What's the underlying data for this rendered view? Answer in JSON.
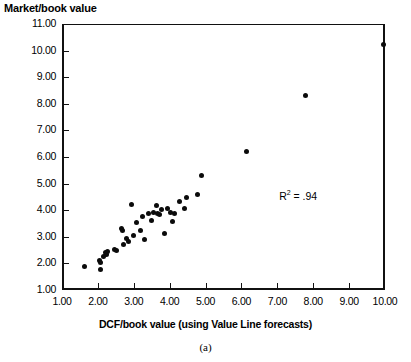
{
  "figure": {
    "panel_label": "(a)",
    "y_axis_title": "Market/book value",
    "x_axis_title": "DCF/book value (using Value Line forecasts)",
    "annotation_r2_prefix": "R",
    "annotation_r2_exponent": "2",
    "annotation_r2_value": " = .94"
  },
  "chart_data": {
    "type": "scatter",
    "title": "",
    "xlabel": "DCF/book value (using Value Line forecasts)",
    "ylabel": "Market/book value",
    "xlim": [
      1.0,
      10.0
    ],
    "ylim": [
      1.0,
      11.0
    ],
    "grid": false,
    "legend": "none",
    "xticks": [
      1.0,
      2.0,
      3.0,
      4.0,
      5.0,
      6.0,
      7.0,
      8.0,
      9.0,
      10.0
    ],
    "xtick_labels": [
      "1.00",
      "2.00",
      "3.00",
      "4.00",
      "5.00",
      "6.00",
      "7.00",
      "8.00",
      "9.00",
      "10.00"
    ],
    "yticks": [
      1.0,
      2.0,
      3.0,
      4.0,
      5.0,
      6.0,
      7.0,
      8.0,
      9.0,
      10.0,
      11.0
    ],
    "ytick_labels": [
      "1.00",
      "2.00",
      "3.00",
      "4.00",
      "5.00",
      "6.00",
      "7.00",
      "8.00",
      "9.00",
      "10.00",
      "11.00"
    ],
    "annotations": [
      {
        "text": "R2 = .94",
        "x": 7.05,
        "y": 4.55
      }
    ],
    "marker": {
      "shape": "circle",
      "color": "#0b0b0b",
      "size": 5
    },
    "points": [
      {
        "x": 1.63,
        "y": 1.88
      },
      {
        "x": 2.05,
        "y": 2.1
      },
      {
        "x": 2.06,
        "y": 2.02
      },
      {
        "x": 2.08,
        "y": 1.77
      },
      {
        "x": 2.15,
        "y": 2.25
      },
      {
        "x": 2.2,
        "y": 2.4
      },
      {
        "x": 2.24,
        "y": 2.35
      },
      {
        "x": 2.28,
        "y": 2.44
      },
      {
        "x": 2.46,
        "y": 2.52
      },
      {
        "x": 2.52,
        "y": 2.48
      },
      {
        "x": 2.66,
        "y": 3.32
      },
      {
        "x": 2.68,
        "y": 3.24
      },
      {
        "x": 2.72,
        "y": 2.72
      },
      {
        "x": 2.8,
        "y": 2.92
      },
      {
        "x": 2.86,
        "y": 2.84
      },
      {
        "x": 2.93,
        "y": 4.22
      },
      {
        "x": 2.98,
        "y": 3.06
      },
      {
        "x": 3.08,
        "y": 3.52
      },
      {
        "x": 3.18,
        "y": 3.22
      },
      {
        "x": 3.24,
        "y": 3.76
      },
      {
        "x": 3.3,
        "y": 2.9
      },
      {
        "x": 3.42,
        "y": 3.86
      },
      {
        "x": 3.48,
        "y": 3.62
      },
      {
        "x": 3.56,
        "y": 3.9
      },
      {
        "x": 3.62,
        "y": 4.16
      },
      {
        "x": 3.66,
        "y": 3.88
      },
      {
        "x": 3.72,
        "y": 3.84
      },
      {
        "x": 3.76,
        "y": 4.02
      },
      {
        "x": 3.86,
        "y": 3.12
      },
      {
        "x": 3.94,
        "y": 4.06
      },
      {
        "x": 4.02,
        "y": 3.9
      },
      {
        "x": 4.08,
        "y": 3.56
      },
      {
        "x": 4.14,
        "y": 3.86
      },
      {
        "x": 4.28,
        "y": 4.32
      },
      {
        "x": 4.4,
        "y": 4.06
      },
      {
        "x": 4.48,
        "y": 4.46
      },
      {
        "x": 4.78,
        "y": 4.6
      },
      {
        "x": 4.9,
        "y": 5.32
      },
      {
        "x": 6.15,
        "y": 6.2
      },
      {
        "x": 7.78,
        "y": 8.3
      },
      {
        "x": 9.96,
        "y": 10.22
      }
    ]
  }
}
